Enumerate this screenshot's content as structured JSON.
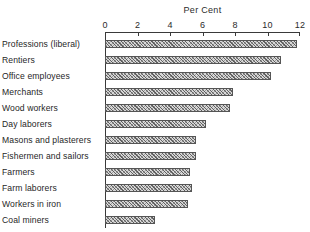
{
  "chart_data": {
    "type": "bar",
    "orientation": "horizontal",
    "title": "Per Cent",
    "xlabel": "",
    "ylabel": "",
    "xlim": [
      0,
      12
    ],
    "grid": false,
    "legend": null,
    "tick_labels": [
      "0",
      "2",
      "4",
      "6",
      "8",
      "10",
      "12"
    ],
    "ticks": [
      0,
      2,
      4,
      6,
      8,
      10,
      12
    ],
    "categories": [
      "Professions (liberal)",
      "Rentiers",
      "Office employees",
      "Merchants",
      "Wood workers",
      "Day laborers",
      "Masons and plasterers",
      "Fishermen and sailors",
      "Farmers",
      "Farm laborers",
      "Workers in iron",
      "Coal miners"
    ],
    "values": [
      11.8,
      10.8,
      10.2,
      7.9,
      7.7,
      6.2,
      5.6,
      5.6,
      5.2,
      5.35,
      5.1,
      3.05
    ],
    "bar_fill": "#d8d8d8",
    "bar_edge": "#555555",
    "axis_color": "#3a3a3a",
    "text_color": "#1f1f1f",
    "background": "#ffffff"
  }
}
